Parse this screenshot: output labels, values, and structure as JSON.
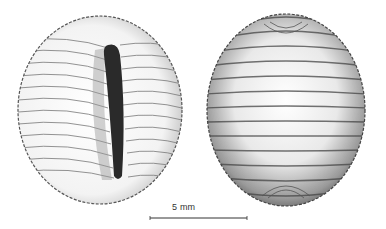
{
  "figure": {
    "views": [
      {
        "name": "ventral view",
        "position": "left"
      },
      {
        "name": "dorsal view",
        "position": "right"
      }
    ],
    "scale_bar": {
      "label": "5 mm",
      "color": "#333333"
    },
    "colors": {
      "ink": "#333333",
      "aperture": "#2a2a2a",
      "paper": "#ffffff"
    }
  }
}
